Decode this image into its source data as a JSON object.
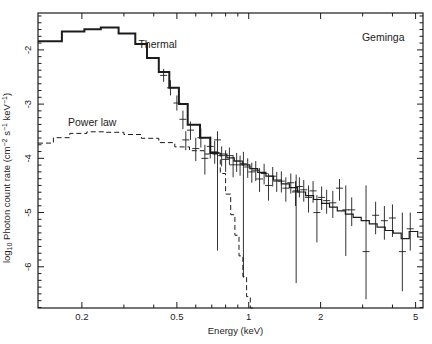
{
  "colors": {
    "ink": "#1c1c1c",
    "background": "#ffffff"
  },
  "chart_data": {
    "type": "line",
    "source_label": "Geminga",
    "xlabel": "Energy (keV)",
    "ylabel_parts": [
      {
        "t": "log",
        "s": "n"
      },
      {
        "t": "10",
        "s": "sub"
      },
      {
        "t": " Photon count rate (cm",
        "s": "n"
      },
      {
        "t": "−2",
        "s": "sup"
      },
      {
        "t": " s",
        "s": "n"
      },
      {
        "t": "−1",
        "s": "sup"
      },
      {
        "t": " keV",
        "s": "n"
      },
      {
        "t": "−1",
        "s": "sup"
      },
      {
        "t": ")",
        "s": "n"
      }
    ],
    "x_scale": "log",
    "xlim": [
      0.131,
      5.37
    ],
    "ylim": [
      -6.76,
      -1.32
    ],
    "grid": false,
    "x_major_ticks": [
      {
        "value": 0.2,
        "label": "0.2"
      },
      {
        "value": 0.5,
        "label": "0.5"
      },
      {
        "value": 1,
        "label": "1"
      },
      {
        "value": 2,
        "label": "2"
      },
      {
        "value": 5,
        "label": "5"
      }
    ],
    "x_minor_ticks": [
      0.3,
      0.4,
      0.6,
      0.7,
      0.8,
      0.9,
      3,
      4
    ],
    "y_major_ticks": [
      {
        "value": -2,
        "label": "-2"
      },
      {
        "value": -3,
        "label": "-3"
      },
      {
        "value": -4,
        "label": "-4"
      },
      {
        "value": -5,
        "label": "-5"
      },
      {
        "value": -6,
        "label": "-6"
      }
    ],
    "y_minor_step": 0.125,
    "annotations": [
      {
        "name": "thermal-label",
        "text": "Thermal",
        "E": 0.345,
        "v": -1.97,
        "anchor": "start"
      },
      {
        "name": "power-law-label",
        "text": "Power law",
        "E": 0.175,
        "v": -3.4,
        "anchor": "start"
      },
      {
        "name": "source-label",
        "text": "Geminga",
        "E": 2.98,
        "v": -1.83,
        "anchor": "start"
      }
    ],
    "series": [
      {
        "name": "thermal",
        "label": "Thermal",
        "style": "solid",
        "width": 2.0,
        "xend": 0.75,
        "steps": [
          [
            0.131,
            -1.84
          ],
          [
            0.165,
            -1.66
          ],
          [
            0.205,
            -1.62
          ],
          [
            0.24,
            -1.59
          ],
          [
            0.285,
            -1.7
          ],
          [
            0.335,
            -1.89
          ],
          [
            0.375,
            -2.15
          ],
          [
            0.42,
            -2.41
          ],
          [
            0.465,
            -2.7
          ],
          [
            0.51,
            -3.0
          ],
          [
            0.555,
            -3.38
          ],
          [
            0.625,
            -3.62
          ],
          [
            0.69,
            -3.9
          ]
        ]
      },
      {
        "name": "thermal-cutoff",
        "label": "",
        "style": "dashed",
        "width": 1.0,
        "xend": 1.05,
        "steps": [
          [
            0.75,
            -3.9
          ],
          [
            0.76,
            -4.28
          ],
          [
            0.8,
            -4.66
          ],
          [
            0.84,
            -5.04
          ],
          [
            0.875,
            -5.42
          ],
          [
            0.91,
            -5.8
          ],
          [
            0.945,
            -6.18
          ],
          [
            0.98,
            -6.55
          ],
          [
            1.015,
            -6.76
          ]
        ]
      },
      {
        "name": "power-law",
        "label": "Power law",
        "style": "dashed",
        "width": 1.0,
        "xend": 0.75,
        "steps": [
          [
            0.131,
            -3.72
          ],
          [
            0.152,
            -3.62
          ],
          [
            0.178,
            -3.54
          ],
          [
            0.21,
            -3.51
          ],
          [
            0.25,
            -3.52
          ],
          [
            0.3,
            -3.56
          ],
          [
            0.355,
            -3.63
          ],
          [
            0.42,
            -3.71
          ],
          [
            0.49,
            -3.79
          ],
          [
            0.565,
            -3.86
          ],
          [
            0.65,
            -3.92
          ]
        ]
      },
      {
        "name": "total",
        "label": "",
        "style": "solid",
        "width": 1.2,
        "xend": 5.37,
        "steps": [
          [
            0.75,
            -3.92
          ],
          [
            0.81,
            -3.99
          ],
          [
            0.87,
            -4.05
          ],
          [
            0.94,
            -4.12
          ],
          [
            1.01,
            -4.19
          ],
          [
            1.09,
            -4.26
          ],
          [
            1.18,
            -4.33
          ],
          [
            1.27,
            -4.4
          ],
          [
            1.37,
            -4.47
          ],
          [
            1.48,
            -4.54
          ],
          [
            1.6,
            -4.62
          ],
          [
            1.73,
            -4.69
          ],
          [
            1.87,
            -4.76
          ],
          [
            2.02,
            -4.83
          ],
          [
            2.18,
            -4.9
          ],
          [
            2.35,
            -4.97
          ],
          [
            2.54,
            -5.03
          ],
          [
            2.74,
            -5.09
          ],
          [
            2.96,
            -5.15
          ],
          [
            3.2,
            -5.21
          ],
          [
            3.45,
            -5.27
          ],
          [
            3.73,
            -5.33
          ],
          [
            4.03,
            -5.38
          ],
          [
            4.35,
            -5.48
          ],
          [
            4.7,
            -5.35
          ],
          [
            5.1,
            -5.45
          ]
        ]
      }
    ],
    "points_format": [
      "energy_keV",
      "log_rate",
      "bar_top",
      "bar_bottom"
    ],
    "points": [
      [
        0.44,
        -2.47,
        -2.35,
        -2.59
      ],
      [
        0.47,
        -2.7,
        -2.56,
        -2.84
      ],
      [
        0.5,
        -2.98,
        -2.84,
        -3.12
      ],
      [
        0.53,
        -3.28,
        -3.12,
        -3.46
      ],
      [
        0.545,
        -3.66,
        -3.5,
        -3.85
      ],
      [
        0.57,
        -3.48,
        -3.32,
        -3.66
      ],
      [
        0.6,
        -3.82,
        -3.62,
        -4.05
      ],
      [
        0.63,
        -3.62,
        -3.45,
        -3.8
      ],
      [
        0.655,
        -4.0,
        -3.75,
        -4.3
      ],
      [
        0.69,
        -3.78,
        -3.6,
        -4.0
      ],
      [
        0.72,
        -3.88,
        -3.68,
        -4.1
      ],
      [
        0.74,
        -3.66,
        -3.5,
        -5.7
      ],
      [
        0.77,
        -3.95,
        -3.78,
        -4.15
      ],
      [
        0.8,
        -4.02,
        -3.85,
        -4.25
      ],
      [
        0.83,
        -3.95,
        -3.8,
        -4.12
      ],
      [
        0.86,
        -4.12,
        -3.94,
        -4.35
      ],
      [
        0.89,
        -4.05,
        -3.9,
        -4.25
      ],
      [
        0.92,
        -4.12,
        -3.95,
        -4.32
      ],
      [
        0.95,
        -4.1,
        -3.88,
        -6.2
      ],
      [
        0.99,
        -4.16,
        -4.0,
        -4.36
      ],
      [
        1.03,
        -4.25,
        -4.08,
        -4.45
      ],
      [
        1.07,
        -4.22,
        -4.05,
        -4.42
      ],
      [
        1.11,
        -4.38,
        -4.18,
        -4.62
      ],
      [
        1.16,
        -4.28,
        -4.1,
        -4.48
      ],
      [
        1.21,
        -4.5,
        -4.28,
        -4.78
      ],
      [
        1.26,
        -4.33,
        -4.16,
        -4.52
      ],
      [
        1.31,
        -4.42,
        -4.25,
        -4.62
      ],
      [
        1.37,
        -4.42,
        -4.24,
        -4.63
      ],
      [
        1.43,
        -4.55,
        -4.35,
        -4.8
      ],
      [
        1.5,
        -4.45,
        -4.28,
        -4.65
      ],
      [
        1.57,
        -4.62,
        -4.42,
        -4.88
      ],
      [
        1.58,
        -4.6,
        -4.3,
        -6.3
      ],
      [
        1.63,
        -4.52,
        -4.35,
        -4.72
      ],
      [
        1.7,
        -4.58,
        -4.4,
        -4.8
      ],
      [
        1.78,
        -4.72,
        -4.5,
        -5.0
      ],
      [
        1.86,
        -4.6,
        -4.42,
        -4.82
      ],
      [
        1.93,
        -5.0,
        -4.68,
        -5.55
      ],
      [
        2.02,
        -4.72,
        -4.52,
        -4.95
      ],
      [
        2.12,
        -4.78,
        -4.58,
        -5.02
      ],
      [
        2.25,
        -4.82,
        -4.6,
        -5.1
      ],
      [
        2.4,
        -4.55,
        -4.38,
        -4.78
      ],
      [
        2.55,
        -4.95,
        -4.5,
        -5.8
      ],
      [
        2.7,
        -4.95,
        -4.72,
        -5.25
      ],
      [
        3.1,
        -5.72,
        -4.5,
        -6.6
      ],
      [
        3.4,
        -5.05,
        -4.8,
        -5.4
      ],
      [
        3.7,
        -5.15,
        -4.88,
        -5.5
      ],
      [
        4.0,
        -5.1,
        -4.85,
        -5.45
      ],
      [
        4.4,
        -5.72,
        -5.0,
        -6.45
      ],
      [
        4.75,
        -5.3,
        -5.0,
        -5.7
      ]
    ]
  }
}
